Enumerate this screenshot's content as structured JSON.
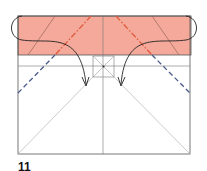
{
  "diagram": {
    "type": "origami-fold-step",
    "colors": {
      "paper_colored_side": "#f4a99a",
      "outline": "#555555",
      "crease": "#9a9a9a",
      "mountain_fold": "#e0593a",
      "valley_fold": "#4a5a8c",
      "arrow": "#222222",
      "background": "#ffffff"
    },
    "elements": [
      "square-outline",
      "colored-top-flap",
      "horizontal-crease",
      "center-vertical-crease",
      "center-small-square",
      "diagonal-creases",
      "mountain-fold-lines",
      "valley-fold-lines",
      "fold-arrows"
    ]
  },
  "caption": {
    "step_number": "11",
    "text": ""
  }
}
